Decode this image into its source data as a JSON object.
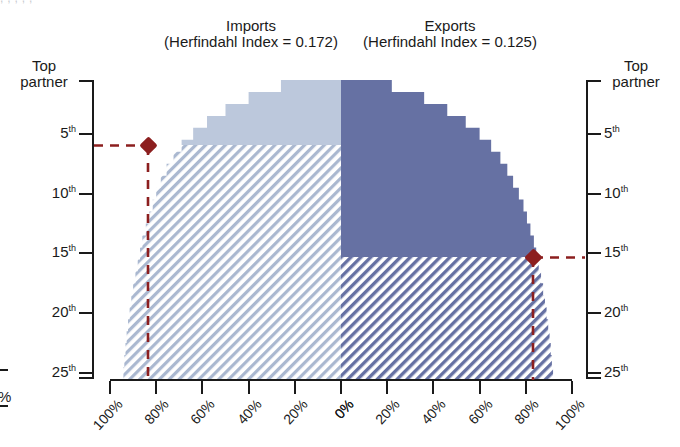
{
  "figure": {
    "top_fragment": ", ,   , ,     ,",
    "background": "#ffffff",
    "axis_color": "#1a1a1a",
    "marker_color": "#8c1f1f"
  },
  "panels": {
    "imports": {
      "title": "Imports",
      "subtitle": "(Herfindahl Index = 0.172)",
      "herfindahl_index": 0.172,
      "fill_color": "#bcc8dc",
      "hatch_color": "#aab8d0"
    },
    "exports": {
      "title": "Exports",
      "subtitle": "(Herfindahl Index = 0.125)",
      "herfindahl_index": 0.125,
      "fill_color": "#6671a3",
      "hatch_color": "#6671a3"
    }
  },
  "y_axis": {
    "corner_label_line1": "Top",
    "corner_label_line2": "partner",
    "ticks": [
      {
        "label": "5",
        "suffix": "th",
        "rank": 5
      },
      {
        "label": "10",
        "suffix": "th",
        "rank": 10
      },
      {
        "label": "15",
        "suffix": "th",
        "rank": 15
      },
      {
        "label": "20",
        "suffix": "th",
        "rank": 20
      },
      {
        "label": "25",
        "suffix": "th",
        "rank": 25
      }
    ]
  },
  "x_axis": {
    "left_ticks": [
      "100%",
      "80%",
      "60%",
      "40%",
      "20%",
      "0%"
    ],
    "right_ticks": [
      "0%",
      "20%",
      "40%",
      "60%",
      "80%",
      "100%"
    ]
  },
  "markers": {
    "imports": {
      "rank": 6,
      "share_pct": 78,
      "label": "imports-threshold-marker"
    },
    "exports": {
      "rank": 15,
      "share_pct": 80,
      "label": "exports-threshold-marker"
    }
  },
  "chart_data": {
    "type": "area",
    "xlabel": "Cumulative share of trade",
    "ylabel": "Partner rank",
    "orientation": "back-to-back horizontal (butterfly)",
    "ylim": [
      1,
      25
    ],
    "xlim_left": [
      100,
      0
    ],
    "xlim_right": [
      0,
      100
    ],
    "grid": false,
    "legend": "none",
    "categories": [
      1,
      2,
      3,
      4,
      5,
      6,
      7,
      8,
      9,
      10,
      11,
      12,
      13,
      14,
      15,
      16,
      17,
      18,
      19,
      20,
      21,
      22,
      23,
      24,
      25
    ],
    "series": [
      {
        "name": "Imports",
        "note": "cumulative share of imports, plotted leftward from 0% at centre",
        "values": [
          26,
          40,
          50,
          58,
          64,
          69,
          72.5,
          75.5,
          78,
          80,
          81.5,
          83,
          84.5,
          86,
          87,
          88,
          89,
          90,
          90.8,
          91.5,
          92.2,
          92.8,
          93.3,
          93.8,
          94.2
        ]
      },
      {
        "name": "Exports",
        "note": "cumulative share of exports, plotted rightward from 0% at centre",
        "values": [
          22,
          36,
          46,
          54,
          60,
          65,
          69,
          72,
          74.5,
          77,
          79,
          80.5,
          82,
          83.5,
          84.5,
          85.6,
          86.6,
          87.5,
          88.3,
          89,
          89.7,
          90.3,
          90.8,
          91.3,
          91.8
        ]
      }
    ],
    "annotations": [
      {
        "series": "Imports",
        "rank": 6,
        "share_pct": 78,
        "style": "red diamond + dashed leader to left axis"
      },
      {
        "series": "Exports",
        "rank": 15,
        "share_pct": 80,
        "style": "red diamond + dashed leader to right axis"
      }
    ],
    "shading": [
      {
        "series": "Imports",
        "region": "above marker rank",
        "style": "solid",
        "color": "#bcc8dc"
      },
      {
        "series": "Imports",
        "region": "below marker rank",
        "style": "diagonal hatch",
        "color": "#aab8d0"
      },
      {
        "series": "Exports",
        "region": "above marker rank",
        "style": "solid",
        "color": "#6671a3"
      },
      {
        "series": "Exports",
        "region": "below marker rank",
        "style": "diagonal hatch",
        "color": "#6671a3"
      }
    ]
  }
}
